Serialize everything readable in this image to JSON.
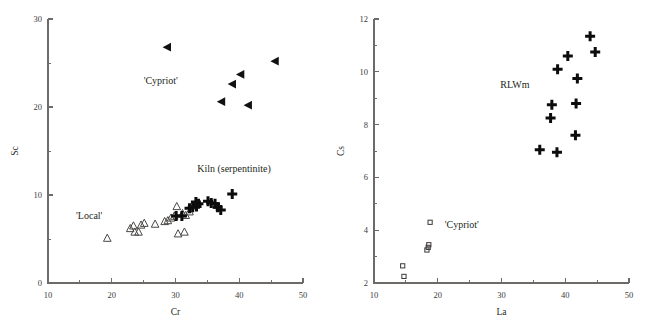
{
  "figure": {
    "background": "#ffffff",
    "panel_count": 2
  },
  "chart_data": [
    {
      "type": "scatter",
      "panel": "left",
      "title": "",
      "xlabel": "Cr",
      "ylabel": "Sc",
      "xlim": [
        10,
        50
      ],
      "ylim": [
        0,
        30
      ],
      "xticks": [
        10,
        20,
        30,
        40,
        50
      ],
      "xtick_labels": [
        "10",
        "20",
        "30",
        "40",
        "50"
      ],
      "xticks_minor": [
        15,
        25,
        35,
        45
      ],
      "yticks": [
        0,
        10,
        20,
        30
      ],
      "ytick_labels": [
        "0",
        "10",
        "20",
        "30"
      ],
      "yticks_minor": [
        5,
        15,
        25
      ],
      "grid": false,
      "legend": "none",
      "annotations": [
        {
          "text": "'Cypriot'",
          "x": 25.0,
          "y": 22.6,
          "anchor": "start"
        },
        {
          "text": "Kiln (serpentinite)",
          "x": 33.4,
          "y": 12.6,
          "anchor": "start"
        },
        {
          "text": "'Local'",
          "x": 14.4,
          "y": 7.3,
          "anchor": "start"
        }
      ],
      "series": [
        {
          "name": "'Cypriot'",
          "marker": "triangle-left-filled",
          "points": [
            {
              "x": 28.7,
              "y": 26.8
            },
            {
              "x": 45.6,
              "y": 25.2
            },
            {
              "x": 40.2,
              "y": 23.7
            },
            {
              "x": 38.9,
              "y": 22.6
            },
            {
              "x": 37.2,
              "y": 20.6
            },
            {
              "x": 41.4,
              "y": 20.2
            }
          ]
        },
        {
          "name": "'Local'",
          "marker": "triangle-up-open",
          "points": [
            {
              "x": 19.3,
              "y": 5.1
            },
            {
              "x": 22.9,
              "y": 6.2
            },
            {
              "x": 23.4,
              "y": 6.5
            },
            {
              "x": 23.6,
              "y": 5.8
            },
            {
              "x": 24.2,
              "y": 5.8
            },
            {
              "x": 24.6,
              "y": 6.6
            },
            {
              "x": 25.1,
              "y": 6.8
            },
            {
              "x": 26.8,
              "y": 6.7
            },
            {
              "x": 28.3,
              "y": 7.0
            },
            {
              "x": 28.8,
              "y": 7.1
            },
            {
              "x": 29.3,
              "y": 7.4
            },
            {
              "x": 29.8,
              "y": 7.6
            },
            {
              "x": 30.2,
              "y": 8.7
            },
            {
              "x": 30.4,
              "y": 5.6
            },
            {
              "x": 31.4,
              "y": 5.8
            },
            {
              "x": 31.1,
              "y": 7.9
            },
            {
              "x": 31.6,
              "y": 7.7
            },
            {
              "x": 32.2,
              "y": 8.1
            }
          ]
        },
        {
          "name": "Kiln (serpentinite)",
          "marker": "plus",
          "points": [
            {
              "x": 30.1,
              "y": 7.6
            },
            {
              "x": 31.0,
              "y": 7.6
            },
            {
              "x": 32.2,
              "y": 8.5
            },
            {
              "x": 32.7,
              "y": 8.6
            },
            {
              "x": 33.2,
              "y": 9.2
            },
            {
              "x": 33.3,
              "y": 8.7
            },
            {
              "x": 33.6,
              "y": 9.0
            },
            {
              "x": 35.1,
              "y": 9.3
            },
            {
              "x": 35.6,
              "y": 9.1
            },
            {
              "x": 36.2,
              "y": 9.0
            },
            {
              "x": 36.6,
              "y": 8.6
            },
            {
              "x": 37.1,
              "y": 8.3
            },
            {
              "x": 38.9,
              "y": 10.1
            }
          ]
        }
      ]
    },
    {
      "type": "scatter",
      "panel": "right",
      "title": "",
      "xlabel": "La",
      "ylabel": "Cs",
      "xlim": [
        10,
        50
      ],
      "ylim": [
        2,
        12
      ],
      "xticks": [
        10,
        20,
        30,
        40,
        50
      ],
      "xtick_labels": [
        "10",
        "20",
        "30",
        "40",
        "50"
      ],
      "xticks_minor": [
        15,
        25,
        35,
        45
      ],
      "yticks": [
        2,
        4,
        6,
        8,
        10,
        12
      ],
      "ytick_labels": [
        "2",
        "4",
        "6",
        "8",
        "10",
        "12"
      ],
      "yticks_minor": [
        3,
        5,
        7,
        9,
        11
      ],
      "grid": false,
      "legend": "none",
      "annotations": [
        {
          "text": "RLWm",
          "x": 29.8,
          "y": 9.4,
          "anchor": "start"
        },
        {
          "text": "'Cypriot'",
          "x": 21.1,
          "y": 4.1,
          "anchor": "start"
        }
      ],
      "series": [
        {
          "name": "RLWm",
          "marker": "plus",
          "points": [
            {
              "x": 36.0,
              "y": 7.05
            },
            {
              "x": 37.7,
              "y": 8.25
            },
            {
              "x": 37.9,
              "y": 8.75
            },
            {
              "x": 38.8,
              "y": 10.1
            },
            {
              "x": 40.4,
              "y": 10.6
            },
            {
              "x": 41.6,
              "y": 7.6
            },
            {
              "x": 41.7,
              "y": 8.8
            },
            {
              "x": 41.9,
              "y": 9.75
            },
            {
              "x": 43.9,
              "y": 11.35
            },
            {
              "x": 44.7,
              "y": 10.75
            },
            {
              "x": 38.7,
              "y": 6.95
            }
          ]
        },
        {
          "name": "'Cypriot'",
          "marker": "square-open",
          "points": [
            {
              "x": 14.5,
              "y": 2.65
            },
            {
              "x": 14.7,
              "y": 2.25
            },
            {
              "x": 18.3,
              "y": 3.25
            },
            {
              "x": 18.6,
              "y": 3.45
            },
            {
              "x": 18.8,
              "y": 4.3
            },
            {
              "x": 18.5,
              "y": 3.35
            }
          ]
        }
      ]
    }
  ]
}
